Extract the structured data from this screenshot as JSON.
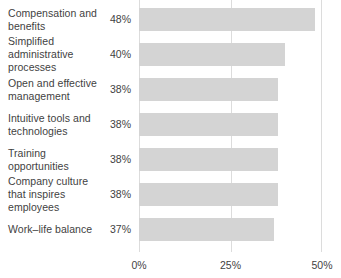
{
  "chart_data": {
    "type": "bar",
    "orientation": "horizontal",
    "title": "",
    "subtitle": "",
    "xlabel": "",
    "ylabel": "",
    "xlim": [
      0,
      50
    ],
    "grid": true,
    "legend": false,
    "legend_position": "none",
    "bar_color": "#d4d4d4",
    "gridline_color": "#dcdcdc",
    "text_color": "#3f3f3f",
    "categories": [
      "Compensation and benefits",
      "Simplified administrative processes",
      "Open and effective management",
      "Intuitive tools and technologies",
      "Training opportunities",
      "Company culture that inspires employees",
      "Work–life balance"
    ],
    "values": [
      48,
      40,
      38,
      38,
      38,
      38,
      37
    ],
    "value_labels": [
      "48%",
      "40%",
      "38%",
      "38%",
      "38%",
      "38%",
      "37%"
    ],
    "xticks": [
      0,
      25,
      50
    ],
    "xtick_labels": [
      "0%",
      "25%",
      "50%"
    ]
  },
  "rows": [
    {
      "category": "Compensation and benefits",
      "value": 48,
      "value_label": "48%"
    },
    {
      "category": "Simplified administrative processes",
      "value": 40,
      "value_label": "40%"
    },
    {
      "category": "Open and effective management",
      "value": 38,
      "value_label": "38%"
    },
    {
      "category": "Intuitive tools and technologies",
      "value": 38,
      "value_label": "38%"
    },
    {
      "category": "Training opportunities",
      "value": 38,
      "value_label": "38%"
    },
    {
      "category": "Company culture that inspires employees",
      "value": 38,
      "value_label": "38%"
    },
    {
      "category": "Work–life balance",
      "value": 37,
      "value_label": "37%"
    }
  ],
  "xaxis": {
    "ticks": [
      {
        "label": "0%",
        "value": 0
      },
      {
        "label": "25%",
        "value": 25
      },
      {
        "label": "50%",
        "value": 50
      }
    ]
  }
}
